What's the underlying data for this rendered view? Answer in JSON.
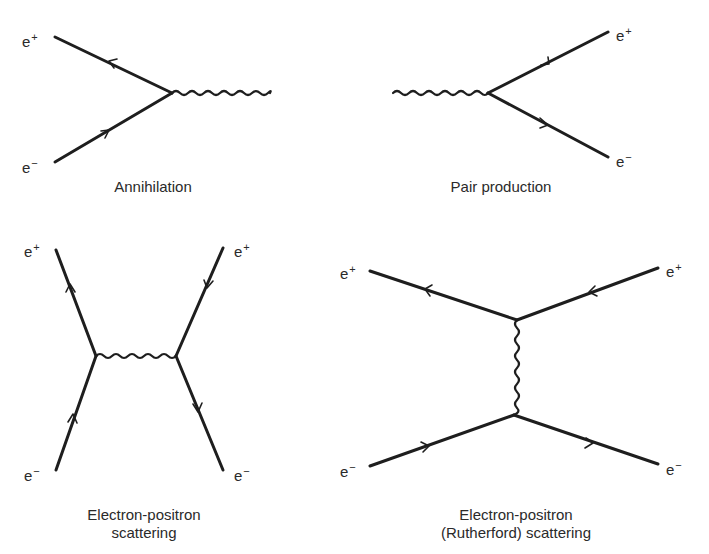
{
  "colors": {
    "line": "#1e1e1e",
    "text": "#2a2a2a",
    "background": "#ffffff"
  },
  "particle_base": "e",
  "charges": {
    "positron": "+",
    "electron": "−"
  },
  "diagrams": [
    {
      "id": "annihilation",
      "caption": [
        "Annihilation"
      ],
      "labels": [
        {
          "particle": "positron",
          "x": 22,
          "y": 30
        },
        {
          "particle": "electron",
          "x": 22,
          "y": 156
        }
      ]
    },
    {
      "id": "pair-production",
      "caption": [
        "Pair production"
      ],
      "labels": [
        {
          "particle": "positron",
          "x": 616,
          "y": 24
        },
        {
          "particle": "electron",
          "x": 616,
          "y": 150
        }
      ]
    },
    {
      "id": "electron-positron-scattering",
      "caption": [
        "Electron-positron",
        "scattering"
      ],
      "labels": [
        {
          "particle": "positron",
          "x": 24,
          "y": 240
        },
        {
          "particle": "positron",
          "x": 234,
          "y": 240
        },
        {
          "particle": "electron",
          "x": 24,
          "y": 464
        },
        {
          "particle": "electron",
          "x": 234,
          "y": 464
        }
      ]
    },
    {
      "id": "rutherford-scattering",
      "caption": [
        "Electron-positron",
        "(Rutherford) scattering"
      ],
      "labels": [
        {
          "particle": "positron",
          "x": 340,
          "y": 262
        },
        {
          "particle": "positron",
          "x": 666,
          "y": 260
        },
        {
          "particle": "electron",
          "x": 340,
          "y": 460
        },
        {
          "particle": "electron",
          "x": 666,
          "y": 458
        }
      ]
    }
  ],
  "captions": {
    "annihilation": "Annihilation",
    "pair_production": "Pair production",
    "ee_scattering_1": "Electron-positron",
    "ee_scattering_2": "scattering",
    "rutherford_1": "Electron-positron",
    "rutherford_2": "(Rutherford) scattering"
  }
}
